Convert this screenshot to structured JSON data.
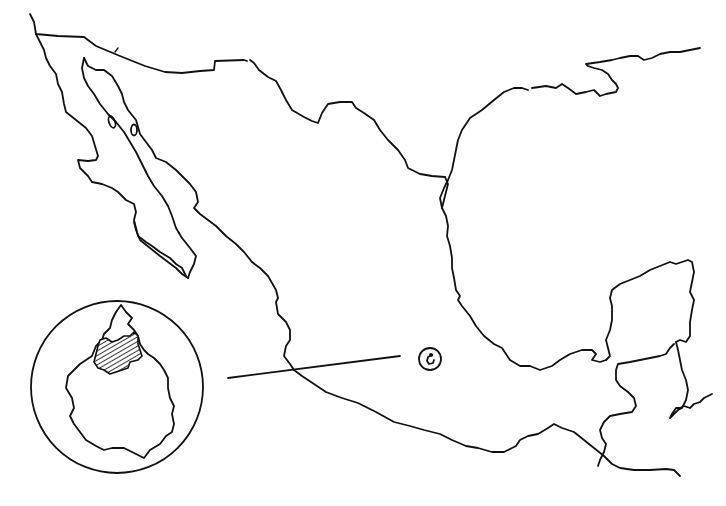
{
  "map": {
    "subject": "Outline map of Mexico",
    "style": "hand-drawn line art",
    "colors": {
      "ink": "#111111",
      "background": "#ffffff",
      "hatch": "#222222"
    },
    "features": [
      {
        "id": "us-border",
        "label": "",
        "type": "border"
      },
      {
        "id": "baja-california",
        "label": "",
        "type": "peninsula"
      },
      {
        "id": "gulf-of-california",
        "label": "",
        "type": "water"
      },
      {
        "id": "pacific-coast",
        "label": "",
        "type": "coastline"
      },
      {
        "id": "gulf-of-mexico-coast",
        "label": "",
        "type": "coastline"
      },
      {
        "id": "yucatan-peninsula",
        "label": "",
        "type": "peninsula"
      },
      {
        "id": "guatemala-belize-border",
        "label": "",
        "type": "border"
      },
      {
        "id": "mexico-city-marker",
        "label": "",
        "type": "location-marker"
      }
    ],
    "inset": {
      "shape": "circle",
      "depicts": "Mexico City federal district outline",
      "highlighted_region": "hatched northern area",
      "leader_line": true
    }
  }
}
